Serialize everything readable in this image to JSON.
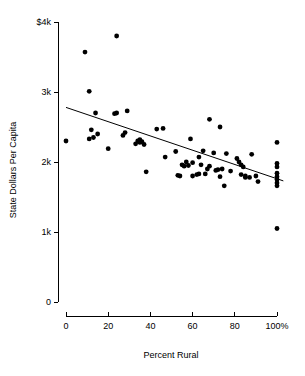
{
  "chart_data": {
    "type": "scatter",
    "title": "",
    "xlabel": "Percent Rural",
    "ylabel": "State Dollars Per Capita",
    "xlim": [
      0,
      100
    ],
    "ylim": [
      0,
      4000
    ],
    "grid": false,
    "legend": null,
    "x_tick_values": [
      0,
      20,
      40,
      60,
      80,
      100
    ],
    "x_tick_labels": [
      "0",
      "20",
      "40",
      "60",
      "80",
      "100%"
    ],
    "y_tick_values": [
      0,
      1000,
      2000,
      3000,
      4000
    ],
    "y_tick_labels": [
      "0",
      "1k",
      "2k",
      "3k",
      "$4k"
    ],
    "point_color": "#000000",
    "line_color": "#000000",
    "trend_line": {
      "type": "linear-fit",
      "x_start": 0,
      "y_start": 2780,
      "x_end": 103,
      "y_end": 1730
    },
    "points": [
      {
        "x": 0,
        "y": 2300
      },
      {
        "x": 9,
        "y": 3570
      },
      {
        "x": 11,
        "y": 3010
      },
      {
        "x": 11,
        "y": 2330
      },
      {
        "x": 12,
        "y": 2460
      },
      {
        "x": 13,
        "y": 2350
      },
      {
        "x": 14,
        "y": 2700
      },
      {
        "x": 15,
        "y": 2400
      },
      {
        "x": 20,
        "y": 2190
      },
      {
        "x": 23,
        "y": 2690
      },
      {
        "x": 24,
        "y": 3800
      },
      {
        "x": 24,
        "y": 2700
      },
      {
        "x": 27,
        "y": 2380
      },
      {
        "x": 28,
        "y": 2420
      },
      {
        "x": 29,
        "y": 2730
      },
      {
        "x": 33,
        "y": 2260
      },
      {
        "x": 34,
        "y": 2300
      },
      {
        "x": 35,
        "y": 2320
      },
      {
        "x": 35,
        "y": 2280
      },
      {
        "x": 36,
        "y": 2290
      },
      {
        "x": 37,
        "y": 2250
      },
      {
        "x": 38,
        "y": 1860
      },
      {
        "x": 43,
        "y": 2470
      },
      {
        "x": 46,
        "y": 2480
      },
      {
        "x": 47,
        "y": 2070
      },
      {
        "x": 52,
        "y": 2150
      },
      {
        "x": 53,
        "y": 1810
      },
      {
        "x": 54,
        "y": 1800
      },
      {
        "x": 55,
        "y": 1960
      },
      {
        "x": 56,
        "y": 1940
      },
      {
        "x": 57,
        "y": 2000
      },
      {
        "x": 58,
        "y": 1950
      },
      {
        "x": 59,
        "y": 2330
      },
      {
        "x": 60,
        "y": 1990
      },
      {
        "x": 60,
        "y": 1800
      },
      {
        "x": 62,
        "y": 1820
      },
      {
        "x": 63,
        "y": 2070
      },
      {
        "x": 63,
        "y": 1830
      },
      {
        "x": 64,
        "y": 1960
      },
      {
        "x": 65,
        "y": 2160
      },
      {
        "x": 66,
        "y": 1830
      },
      {
        "x": 67,
        "y": 1900
      },
      {
        "x": 68,
        "y": 2610
      },
      {
        "x": 68,
        "y": 1940
      },
      {
        "x": 70,
        "y": 2130
      },
      {
        "x": 71,
        "y": 1880
      },
      {
        "x": 72,
        "y": 1890
      },
      {
        "x": 73,
        "y": 2500
      },
      {
        "x": 73,
        "y": 1790
      },
      {
        "x": 74,
        "y": 1900
      },
      {
        "x": 75,
        "y": 1660
      },
      {
        "x": 76,
        "y": 2120
      },
      {
        "x": 78,
        "y": 1870
      },
      {
        "x": 81,
        "y": 2050
      },
      {
        "x": 82,
        "y": 2000
      },
      {
        "x": 83,
        "y": 1960
      },
      {
        "x": 83,
        "y": 1820
      },
      {
        "x": 84,
        "y": 1930
      },
      {
        "x": 85,
        "y": 1800
      },
      {
        "x": 85,
        "y": 1780
      },
      {
        "x": 87,
        "y": 1780
      },
      {
        "x": 88,
        "y": 2110
      },
      {
        "x": 90,
        "y": 1800
      },
      {
        "x": 91,
        "y": 1720
      },
      {
        "x": 100,
        "y": 2280
      },
      {
        "x": 100,
        "y": 1980
      },
      {
        "x": 100,
        "y": 1930
      },
      {
        "x": 100,
        "y": 1840
      },
      {
        "x": 100,
        "y": 1790
      },
      {
        "x": 100,
        "y": 1750
      },
      {
        "x": 100,
        "y": 1700
      },
      {
        "x": 100,
        "y": 1660
      },
      {
        "x": 100,
        "y": 1050
      }
    ]
  }
}
